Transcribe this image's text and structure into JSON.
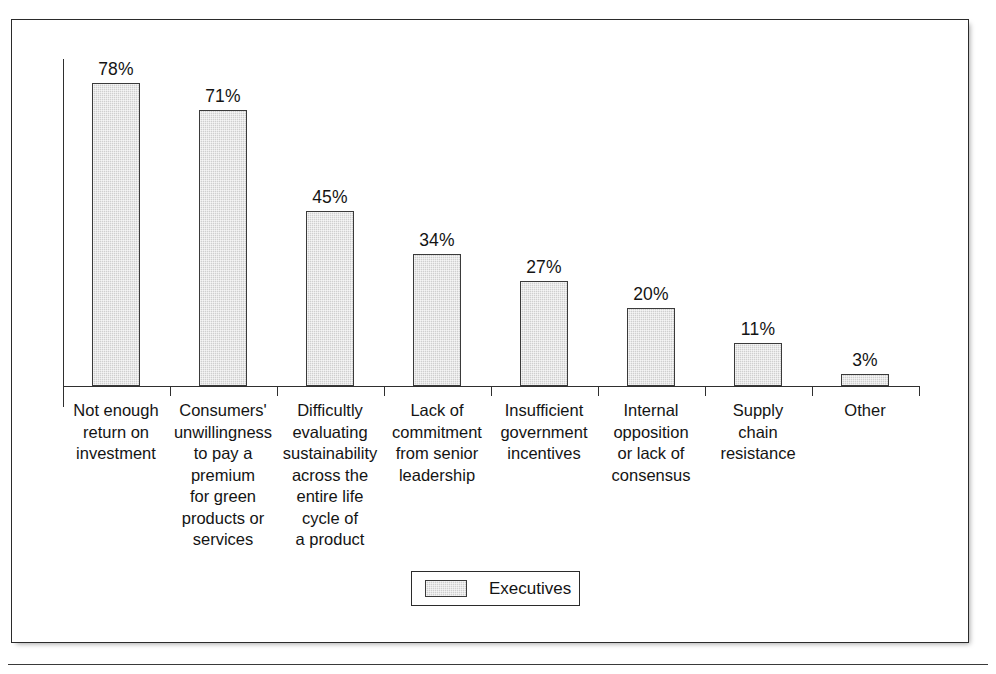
{
  "chart_data": {
    "type": "bar",
    "title": "",
    "xlabel": "",
    "ylabel": "",
    "ylim": [
      0,
      85
    ],
    "grid": false,
    "legend_position": "bottom-center",
    "categories": [
      "Not enough return on investment",
      "Consumers' unwillingness to pay a premium for green products or services",
      "Difficultly evaluating sustainability across the entire life cycle of a product",
      "Lack of commitment from senior leadership",
      "Insufficient government incentives",
      "Internal opposition or lack of consensus",
      "Supply chain resistance",
      "Other"
    ],
    "category_lines": [
      [
        "Not enough",
        "return on",
        "investment"
      ],
      [
        "Consumers'",
        "unwillingness",
        "to pay a",
        "premium",
        "for green",
        "products or",
        "services"
      ],
      [
        "Difficultly",
        "evaluating",
        "sustainability",
        "across the",
        "entire life",
        "cycle of",
        "a product"
      ],
      [
        "Lack of",
        "commitment",
        "from senior",
        "leadership"
      ],
      [
        "Insufficient",
        "government",
        "incentives"
      ],
      [
        "Internal",
        "opposition",
        "or lack of",
        "consensus"
      ],
      [
        "Supply",
        "chain",
        "resistance"
      ],
      [
        "Other"
      ]
    ],
    "values": [
      78,
      71,
      45,
      34,
      27,
      20,
      11,
      3
    ],
    "value_labels": [
      "78%",
      "71%",
      "45%",
      "34%",
      "27%",
      "20%",
      "11%",
      "3%"
    ],
    "series": [
      {
        "name": "Executives",
        "values": [
          78,
          71,
          45,
          34,
          27,
          20,
          11,
          3
        ]
      }
    ],
    "legend": [
      {
        "label": "Executives",
        "swatch_color": "#cfcfcf",
        "swatch_border": "#3a3a3a"
      }
    ]
  },
  "colors": {
    "bar_fill": "#cfcfcf",
    "bar_border": "#3a3a3a",
    "axis": "#2f2f2f",
    "frame": "#2b2b2b",
    "text": "#141414",
    "background": "#ffffff"
  }
}
